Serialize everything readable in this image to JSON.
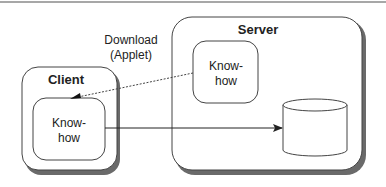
{
  "diagram": {
    "type": "client-server architecture",
    "colors": {
      "stroke": "#333333",
      "shadow": "#666666",
      "rule": "#888888",
      "background": "#ffffff"
    },
    "nodes": [
      {
        "id": "server",
        "label": "Server",
        "kind": "container"
      },
      {
        "id": "server-knowhow",
        "label_line1": "Know-",
        "label_line2": "how",
        "kind": "rounded-box",
        "parent": "server"
      },
      {
        "id": "server-database",
        "label": "",
        "kind": "cylinder",
        "parent": "server"
      },
      {
        "id": "client",
        "label": "Client",
        "kind": "container"
      },
      {
        "id": "client-knowhow",
        "label_line1": "Know-",
        "label_line2": "how",
        "kind": "rounded-box",
        "parent": "client"
      }
    ],
    "edges": [
      {
        "from": "server-knowhow",
        "to": "client-knowhow",
        "style": "dashed",
        "label_line1": "Download",
        "label_line2": "(Applet)"
      },
      {
        "from": "client-knowhow",
        "to": "server-database",
        "style": "solid",
        "label": ""
      }
    ]
  }
}
